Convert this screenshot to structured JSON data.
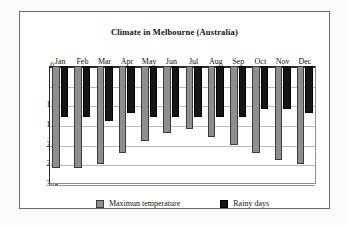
{
  "chart_data": {
    "type": "bar",
    "title": "Climate in Melbourne (Australia)",
    "xlabel": "",
    "ylabel": "",
    "categories": [
      "Jan",
      "Feb",
      "Mar",
      "Apr",
      "May",
      "Jun",
      "Jul",
      "Aug",
      "Sep",
      "Oct",
      "Nov",
      "Dec"
    ],
    "series": [
      {
        "name": "Maximun temperature",
        "color": "#8e8e8e",
        "values": [
          26,
          26,
          25,
          22,
          19,
          17,
          16,
          18,
          20,
          22,
          24,
          25
        ]
      },
      {
        "name": "Rainy days",
        "color": "#151515",
        "values": [
          13,
          13,
          14,
          12,
          13,
          13,
          13,
          13,
          13,
          11,
          11,
          12
        ]
      }
    ],
    "ylim": [
      0,
      30
    ],
    "y_inverted": true,
    "yticks": [
      0,
      5,
      10,
      15,
      20,
      25,
      30
    ],
    "ytick_labels": [
      "0",
      "5",
      "10",
      "15",
      "20",
      "25",
      "30"
    ],
    "grid": true,
    "legend_position": "bottom",
    "category_labels_position": "top"
  },
  "legend": {
    "items": [
      {
        "label": "Maximun temperature",
        "swatch": "gray-square-icon"
      },
      {
        "label": "Rainy days",
        "swatch": "black-square-icon"
      }
    ]
  }
}
